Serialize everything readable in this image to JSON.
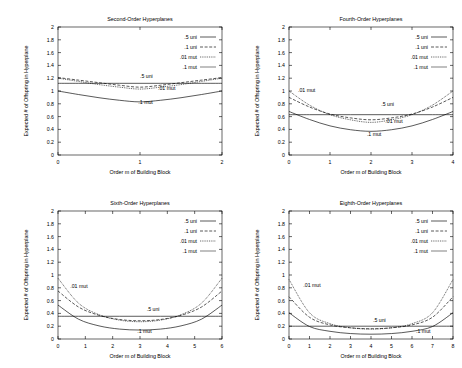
{
  "figure": {
    "background": "#ffffff",
    "ink": "#000000",
    "panel_count": 4
  },
  "common": {
    "xlabel": "Order m of Building Block",
    "ylabel": "Expected # of Offspring in Hyperplane",
    "ylim": [
      0,
      2
    ],
    "yticks": [
      "0",
      "0.2",
      "0.4",
      "0.6",
      "0.8",
      "1",
      "1.2",
      "1.4",
      "1.6",
      "1.8",
      "2"
    ],
    "legend_entries": [
      ".5 uni",
      ".1 uni",
      ".01 mut",
      ".1 mut"
    ],
    "legend_position": "top-right inside",
    "grid": false
  },
  "chart_data": [
    {
      "type": "line",
      "panel": "top-left",
      "title": "Second-Order Hyperplanes",
      "xlabel": "Order m of Building Block",
      "ylabel": "Expected # of Offspring in Hyperplane",
      "xlim": [
        0,
        2
      ],
      "ylim": [
        0,
        2
      ],
      "xticks": [
        "0",
        "1",
        "2"
      ],
      "yticks": [
        "0",
        "0.2",
        "0.4",
        "0.6",
        "0.8",
        "1",
        "1.2",
        "1.4",
        "1.6",
        "1.8",
        "2"
      ],
      "grid": false,
      "legend": [
        ".5 uni",
        ".1 uni",
        ".01 mut",
        ".1 mut"
      ],
      "annotations": [
        {
          "text": ".5 uni",
          "x": 1.0,
          "y": 1.21
        },
        {
          "text": ".01 mut",
          "x": 1.22,
          "y": 1.01
        },
        {
          "text": ".1 mut",
          "x": 0.98,
          "y": 0.79
        }
      ],
      "x": [
        0,
        0.25,
        0.5,
        0.75,
        1,
        1.25,
        1.5,
        1.75,
        2
      ],
      "series": [
        {
          "name": ".5 uni",
          "style": "solid",
          "values": [
            1.12,
            1.12,
            1.12,
            1.12,
            1.12,
            1.12,
            1.12,
            1.12,
            1.12
          ]
        },
        {
          "name": ".1 uni",
          "style": "dashed",
          "values": [
            1.21,
            1.17,
            1.13,
            1.09,
            1.06,
            1.09,
            1.13,
            1.17,
            1.21
          ]
        },
        {
          "name": ".01 mut",
          "style": "dotted",
          "values": [
            1.2,
            1.15,
            1.1,
            1.06,
            1.03,
            1.06,
            1.1,
            1.15,
            1.2
          ]
        },
        {
          "name": ".1 mut",
          "style": "thin-solid",
          "values": [
            1.0,
            0.945,
            0.895,
            0.855,
            0.83,
            0.855,
            0.895,
            0.945,
            1.0
          ]
        }
      ]
    },
    {
      "type": "line",
      "panel": "top-right",
      "title": "Fourth-Order Hyperplanes",
      "xlabel": "Order m of Building Block",
      "ylabel": "Expected # of Offspring in Hyperplane",
      "xlim": [
        0,
        4
      ],
      "ylim": [
        0,
        2
      ],
      "xticks": [
        "0",
        "1",
        "2",
        "3",
        "4"
      ],
      "yticks": [
        "0",
        "0.2",
        "0.4",
        "0.6",
        "0.8",
        "1",
        "1.2",
        "1.4",
        "1.6",
        "1.8",
        "2"
      ],
      "grid": false,
      "legend": [
        ".5 uni",
        ".1 uni",
        ".01 mut",
        ".1 mut"
      ],
      "annotations": [
        {
          "text": ".01 mut",
          "x": 0.22,
          "y": 0.99
        },
        {
          "text": ".5 uni",
          "x": 2.25,
          "y": 0.76
        },
        {
          "text": ".01 mut",
          "x": 2.35,
          "y": 0.5
        },
        {
          "text": ".1 mut",
          "x": 1.9,
          "y": 0.29
        }
      ],
      "x": [
        0,
        0.5,
        1,
        1.5,
        2,
        2.5,
        3,
        3.5,
        4
      ],
      "series": [
        {
          "name": ".5 uni",
          "style": "solid",
          "values": [
            0.63,
            0.63,
            0.63,
            0.63,
            0.63,
            0.63,
            0.63,
            0.63,
            0.63
          ]
        },
        {
          "name": ".1 uni",
          "style": "dashed",
          "values": [
            0.9,
            0.75,
            0.64,
            0.58,
            0.55,
            0.58,
            0.64,
            0.75,
            0.9
          ]
        },
        {
          "name": ".01 mut",
          "style": "dotted",
          "values": [
            1.0,
            0.78,
            0.63,
            0.55,
            0.51,
            0.55,
            0.63,
            0.78,
            1.0
          ]
        },
        {
          "name": ".1 mut",
          "style": "thin-solid",
          "values": [
            0.68,
            0.555,
            0.455,
            0.395,
            0.37,
            0.395,
            0.455,
            0.555,
            0.68
          ]
        }
      ]
    },
    {
      "type": "line",
      "panel": "bottom-left",
      "title": "Sixth-Order Hyperplanes",
      "xlabel": "Order m of Building Block",
      "ylabel": "Expected # of Offspring in Hyperplane",
      "xlim": [
        0,
        6
      ],
      "ylim": [
        0,
        2
      ],
      "xticks": [
        "0",
        "1",
        "2",
        "3",
        "4",
        "5",
        "6"
      ],
      "yticks": [
        "0",
        "0.2",
        "0.4",
        "0.6",
        "0.8",
        "1",
        "1.2",
        "1.4",
        "1.6",
        "1.8",
        "2"
      ],
      "grid": false,
      "legend": [
        ".5 uni",
        ".1 uni",
        ".01 mut",
        ".1 mut"
      ],
      "annotations": [
        {
          "text": ".01 mut",
          "x": 0.45,
          "y": 0.8
        },
        {
          "text": ".5 uni",
          "x": 3.25,
          "y": 0.43
        },
        {
          "text": ".1 mut",
          "x": 2.9,
          "y": 0.09
        }
      ],
      "x": [
        0,
        0.75,
        1.5,
        2.25,
        3,
        3.75,
        4.5,
        5.25,
        6
      ],
      "series": [
        {
          "name": ".5 uni",
          "style": "solid",
          "values": [
            0.355,
            0.355,
            0.355,
            0.355,
            0.355,
            0.355,
            0.355,
            0.355,
            0.355
          ]
        },
        {
          "name": ".1 uni",
          "style": "dashed",
          "values": [
            0.75,
            0.5,
            0.37,
            0.305,
            0.285,
            0.305,
            0.37,
            0.5,
            0.75
          ]
        },
        {
          "name": ".01 mut",
          "style": "dotted",
          "values": [
            0.95,
            0.56,
            0.38,
            0.295,
            0.27,
            0.295,
            0.38,
            0.56,
            0.95
          ]
        },
        {
          "name": ".1 mut",
          "style": "thin-solid",
          "values": [
            0.53,
            0.31,
            0.205,
            0.155,
            0.14,
            0.155,
            0.205,
            0.31,
            0.53
          ]
        }
      ]
    },
    {
      "type": "line",
      "panel": "bottom-right",
      "title": "Eighth-Order Hyperplanes",
      "xlabel": "Order m of Building Block",
      "ylabel": "Expected # of Offspring in Hyperplane",
      "xlim": [
        0,
        8
      ],
      "ylim": [
        0,
        2
      ],
      "xticks": [
        "0",
        "1",
        "2",
        "3",
        "4",
        "5",
        "6",
        "7",
        "8"
      ],
      "yticks": [
        "0",
        "0.2",
        "0.4",
        "0.6",
        "0.8",
        "1",
        "1.2",
        "1.4",
        "1.6",
        "1.8",
        "2"
      ],
      "grid": false,
      "legend": [
        ".5 uni",
        ".1 uni",
        ".01 mut",
        ".1 mut"
      ],
      "annotations": [
        {
          "text": ".01 mut",
          "x": 0.7,
          "y": 0.82
        },
        {
          "text": ".5 uni",
          "x": 4.1,
          "y": 0.27
        },
        {
          "text": ".1 mut",
          "x": 6.2,
          "y": 0.09
        }
      ],
      "x": [
        0,
        1,
        2,
        3,
        4,
        5,
        6,
        7,
        8
      ],
      "series": [
        {
          "name": ".5 uni",
          "style": "solid",
          "values": [
            0.2,
            0.2,
            0.2,
            0.2,
            0.2,
            0.2,
            0.2,
            0.2,
            0.2
          ]
        },
        {
          "name": ".1 uni",
          "style": "dashed",
          "values": [
            0.66,
            0.34,
            0.22,
            0.175,
            0.16,
            0.175,
            0.22,
            0.34,
            0.66
          ]
        },
        {
          "name": ".01 mut",
          "style": "dotted",
          "values": [
            0.93,
            0.41,
            0.24,
            0.175,
            0.155,
            0.175,
            0.24,
            0.41,
            0.93
          ]
        },
        {
          "name": ".1 mut",
          "style": "thin-solid",
          "values": [
            0.41,
            0.195,
            0.12,
            0.085,
            0.075,
            0.085,
            0.12,
            0.195,
            0.41
          ]
        }
      ]
    }
  ]
}
